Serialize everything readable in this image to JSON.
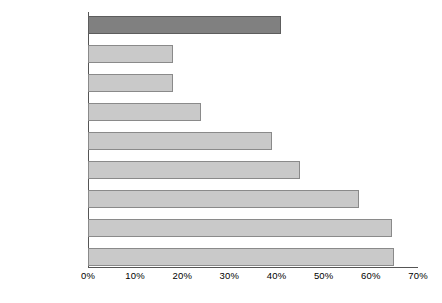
{
  "chart_data": {
    "type": "bar",
    "orientation": "horizontal",
    "title": "",
    "xlabel": "",
    "ylabel": "",
    "xlim": [
      0,
      70
    ],
    "grid": false,
    "legend": false,
    "tick_suffix": "%",
    "categories": [
      "EU AVERAGE",
      "NORWAY",
      "SWITZERLAND",
      "U.K.",
      "GERMANY",
      "ITALY",
      "SPAIN",
      "FRANCE",
      "BELGIUM"
    ],
    "values": [
      41,
      18,
      18,
      24,
      39,
      45,
      57.5,
      64.5,
      65
    ],
    "highlight_index": 0,
    "xticks": [
      0,
      10,
      20,
      30,
      40,
      50,
      60,
      70
    ],
    "xticklabels": [
      "0%",
      "10%",
      "20%",
      "30%",
      "40%",
      "50%",
      "60%",
      "70%"
    ],
    "colors": {
      "bar": "#c9c9c9",
      "bar_border": "#8a8a8a",
      "highlight_bar": "#808080",
      "highlight_bar_border": "#5d5d5d",
      "axis": "#555555",
      "text": "#000000",
      "background": "#ffffff"
    }
  }
}
